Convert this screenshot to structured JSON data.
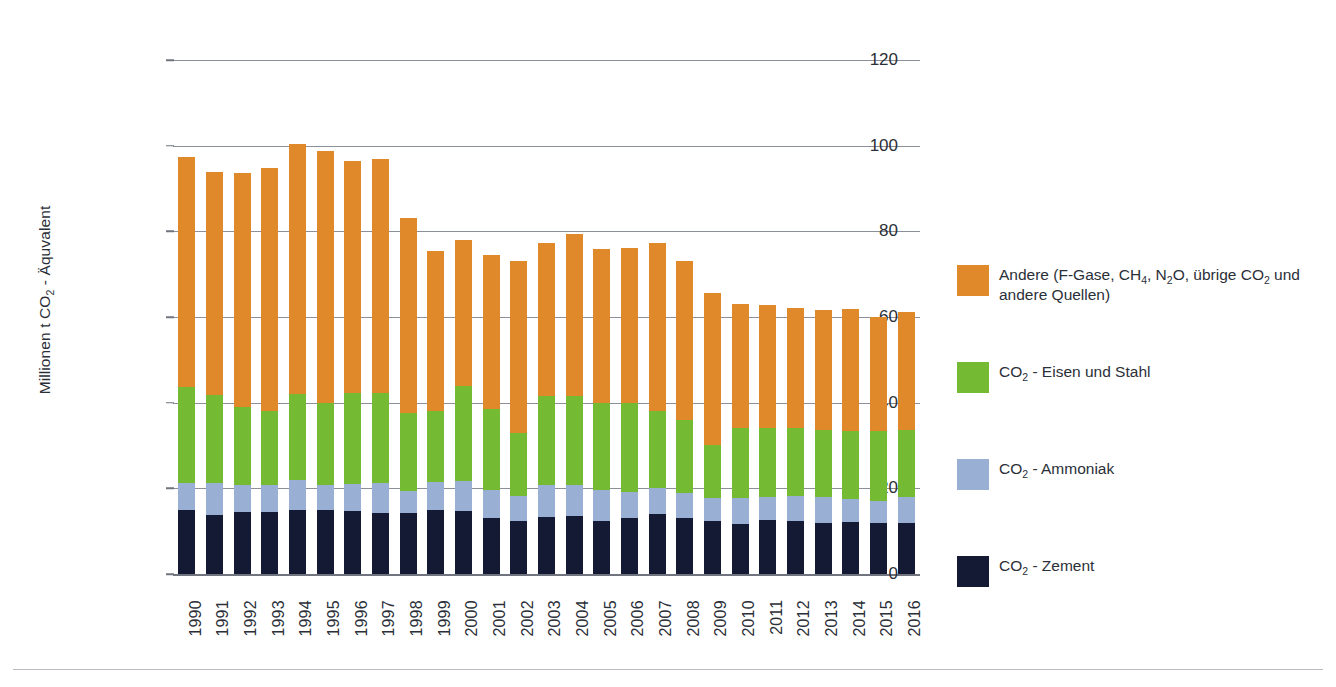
{
  "chart_data": {
    "type": "bar",
    "stacked": true,
    "title": "",
    "subtitle": "",
    "xlabel": "",
    "ylabel": "Millionen t CO2 - Äquvalent",
    "ylabel_parts": [
      "Millionen t CO",
      "2",
      " - Äquvalent"
    ],
    "ylim": [
      0,
      120
    ],
    "yticks": [
      0,
      20,
      40,
      60,
      80,
      100,
      120
    ],
    "ytick_labels": [
      "0",
      "20",
      "40",
      "60",
      "80",
      "100",
      "120"
    ],
    "grid": "horizontal",
    "legend_position": "right",
    "categories": [
      "1990",
      "1991",
      "1992",
      "1993",
      "1994",
      "1995",
      "1996",
      "1997",
      "1998",
      "1999",
      "2000",
      "2001",
      "2002",
      "2003",
      "2004",
      "2005",
      "2006",
      "2007",
      "2008",
      "2009",
      "2010",
      "2011",
      "2012",
      "2013",
      "2014",
      "2015",
      "2016"
    ],
    "series": [
      {
        "name": "CO2 - Zement",
        "color": "#141a33",
        "values": [
          15.0,
          13.7,
          14.4,
          14.4,
          15.0,
          15.0,
          14.6,
          14.3,
          14.2,
          15.0,
          14.8,
          13.0,
          12.3,
          13.2,
          13.5,
          12.4,
          13.0,
          14.0,
          13.0,
          12.4,
          11.7,
          12.5,
          12.4,
          12.0,
          12.2,
          12.0,
          12.0
        ]
      },
      {
        "name": "CO2 - Ammoniak",
        "color": "#9aafd4",
        "values": [
          6.2,
          7.6,
          6.4,
          6.3,
          7.0,
          5.7,
          6.5,
          6.9,
          5.3,
          6.5,
          7.0,
          6.6,
          6.0,
          7.7,
          7.3,
          7.3,
          6.2,
          6.2,
          6.0,
          5.4,
          6.1,
          5.4,
          5.8,
          6.0,
          5.2,
          5.0,
          6.0
        ]
      },
      {
        "name": "CO2 - Eisen und Stahl",
        "color": "#74bb33",
        "values": [
          22.4,
          20.5,
          18.2,
          17.3,
          20.0,
          19.3,
          21.2,
          21.0,
          18.2,
          16.5,
          22.2,
          18.9,
          14.7,
          20.6,
          20.7,
          20.3,
          20.8,
          17.8,
          17.0,
          12.4,
          16.2,
          16.1,
          15.8,
          15.7,
          16.1,
          16.3,
          15.6
        ]
      },
      {
        "name": "Andere (F-Gase, CH4, N2O, übrige CO2 und andere Quellen)",
        "color": "#e0892b",
        "values": [
          53.8,
          52.0,
          54.7,
          56.7,
          58.5,
          58.8,
          54.2,
          54.6,
          45.5,
          37.5,
          34.0,
          36.0,
          40.0,
          35.7,
          38.0,
          35.8,
          36.2,
          39.4,
          37.2,
          35.5,
          29.0,
          28.9,
          28.1,
          27.9,
          28.4,
          26.8,
          27.6
        ]
      }
    ],
    "totals": [
      97.4,
      93.8,
      93.7,
      94.7,
      100.5,
      98.8,
      96.5,
      96.8,
      83.2,
      75.5,
      78.0,
      74.5,
      73.0,
      77.2,
      79.5,
      75.8,
      76.2,
      77.4,
      73.2,
      65.7,
      63.0,
      62.9,
      62.1,
      61.6,
      61.9,
      60.1,
      61.2
    ]
  },
  "legend": {
    "items": [
      {
        "color": "#e0892b",
        "name": "legend-item-andere",
        "rich": [
          {
            "t": "Andere (F-Gase, CH"
          },
          {
            "t": "4",
            "sub": true
          },
          {
            "t": ", N"
          },
          {
            "t": "2",
            "sub": true
          },
          {
            "t": "O, übrige CO"
          },
          {
            "t": "2",
            "sub": true
          },
          {
            "t": " und andere Quellen)"
          }
        ],
        "plain": "Andere (F-Gase, CH4, N2O, übrige CO2 und andere Quellen)"
      },
      {
        "color": "#74bb33",
        "name": "legend-item-eisen-stahl",
        "rich": [
          {
            "t": "CO"
          },
          {
            "t": "2",
            "sub": true
          },
          {
            "t": " - Eisen und Stahl"
          }
        ],
        "plain": "CO2 - Eisen und Stahl"
      },
      {
        "color": "#9aafd4",
        "name": "legend-item-ammoniak",
        "rich": [
          {
            "t": "CO"
          },
          {
            "t": "2",
            "sub": true
          },
          {
            "t": " - Ammoniak"
          }
        ],
        "plain": "CO2 - Ammoniak"
      },
      {
        "color": "#141a33",
        "name": "legend-item-zement",
        "rich": [
          {
            "t": "CO"
          },
          {
            "t": "2",
            "sub": true
          },
          {
            "t": " - Zement"
          }
        ],
        "plain": "CO2 - Zement"
      }
    ],
    "row_tops": [
      0,
      97,
      194,
      291
    ]
  },
  "axis_style": {
    "gridline_color": "#8a8f99",
    "text_color": "#2b2f38",
    "footer_rule_color": "#b9bcc2"
  }
}
